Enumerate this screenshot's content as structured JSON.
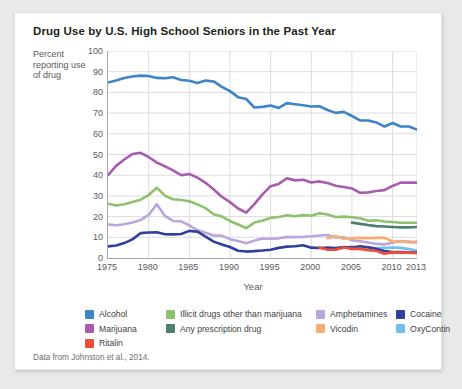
{
  "card": {
    "title": "Drug Use by U.S. High School Seniors in the Past Year",
    "source": "Data from Johnston et al., 2014."
  },
  "chart_data": {
    "type": "line",
    "title": "Drug Use by U.S. High School Seniors in the Past Year",
    "xlabel": "Year",
    "ylabel": "Percent reporting use of drug",
    "xlim": [
      1975,
      2013
    ],
    "ylim": [
      0,
      100
    ],
    "grid": true,
    "legend_position": "bottom",
    "xticks": [
      1975,
      1980,
      1985,
      1990,
      1995,
      2000,
      2005,
      2010,
      2013
    ],
    "yticks": [
      0,
      10,
      20,
      30,
      40,
      50,
      60,
      70,
      80,
      90,
      100
    ],
    "series": [
      {
        "name": "Alcohol",
        "color": "#3d85c8",
        "x": [
          1975,
          1976,
          1977,
          1978,
          1979,
          1980,
          1981,
          1982,
          1983,
          1984,
          1985,
          1986,
          1987,
          1988,
          1989,
          1990,
          1991,
          1992,
          1993,
          1994,
          1995,
          1996,
          1997,
          1998,
          1999,
          2000,
          2001,
          2002,
          2003,
          2004,
          2005,
          2006,
          2007,
          2008,
          2009,
          2010,
          2011,
          2012,
          2013
        ],
        "values": [
          84.8,
          85.7,
          87.0,
          87.7,
          88.1,
          87.9,
          87.0,
          86.8,
          87.3,
          86.0,
          85.6,
          84.5,
          85.7,
          85.3,
          82.7,
          80.6,
          77.7,
          76.8,
          72.7,
          73.0,
          73.7,
          72.5,
          74.8,
          74.3,
          73.8,
          73.2,
          73.3,
          71.5,
          70.1,
          70.6,
          68.6,
          66.5,
          66.4,
          65.5,
          63.5,
          65.2,
          63.5,
          63.5,
          62.0
        ]
      },
      {
        "name": "Marijuana",
        "color": "#a85cb0",
        "x": [
          1975,
          1976,
          1977,
          1978,
          1979,
          1980,
          1981,
          1982,
          1983,
          1984,
          1985,
          1986,
          1987,
          1988,
          1989,
          1990,
          1991,
          1992,
          1993,
          1994,
          1995,
          1996,
          1997,
          1998,
          1999,
          2000,
          2001,
          2002,
          2003,
          2004,
          2005,
          2006,
          2007,
          2008,
          2009,
          2010,
          2011,
          2012,
          2013
        ],
        "values": [
          40.0,
          44.5,
          47.6,
          50.2,
          50.8,
          48.8,
          46.1,
          44.3,
          42.3,
          40.0,
          40.6,
          38.8,
          36.3,
          33.1,
          29.6,
          27.0,
          23.9,
          21.9,
          26.0,
          30.7,
          34.7,
          35.8,
          38.5,
          37.5,
          37.8,
          36.5,
          37.0,
          36.2,
          34.9,
          34.3,
          33.6,
          31.5,
          31.7,
          32.4,
          32.8,
          34.8,
          36.4,
          36.4,
          36.4
        ]
      },
      {
        "name": "Illicit drugs other than marijuana",
        "color": "#8dc26f",
        "x": [
          1975,
          1976,
          1977,
          1978,
          1979,
          1980,
          1981,
          1982,
          1983,
          1984,
          1985,
          1986,
          1987,
          1988,
          1989,
          1990,
          1991,
          1992,
          1993,
          1994,
          1995,
          1996,
          1997,
          1998,
          1999,
          2000,
          2001,
          2002,
          2003,
          2004,
          2005,
          2006,
          2007,
          2008,
          2009,
          2010,
          2011,
          2012,
          2013
        ],
        "values": [
          26.2,
          25.4,
          26.0,
          27.1,
          28.2,
          30.4,
          34.0,
          30.1,
          28.4,
          28.0,
          27.4,
          25.9,
          24.1,
          21.1,
          20.0,
          17.9,
          16.2,
          14.4,
          17.1,
          18.0,
          19.4,
          19.8,
          20.7,
          20.2,
          20.7,
          20.4,
          21.6,
          21.0,
          19.8,
          20.0,
          19.7,
          19.2,
          18.0,
          18.2,
          17.6,
          17.4,
          17.0,
          17.0,
          17.0
        ]
      },
      {
        "name": "Any prescription drug",
        "color": "#4f7d72",
        "x": [
          2005,
          2006,
          2007,
          2008,
          2009,
          2010,
          2011,
          2012,
          2013
        ],
        "values": [
          17.1,
          16.5,
          15.9,
          15.4,
          15.2,
          15.0,
          14.8,
          14.8,
          15.0
        ]
      },
      {
        "name": "Amphetamines",
        "color": "#b9a5e0",
        "x": [
          1975,
          1976,
          1977,
          1978,
          1979,
          1980,
          1981,
          1982,
          1983,
          1984,
          1985,
          1986,
          1987,
          1988,
          1989,
          1990,
          1991,
          1992,
          1993,
          1994,
          1995,
          1996,
          1997,
          1998,
          1999,
          2000,
          2001,
          2002,
          2003,
          2004,
          2005,
          2006,
          2007,
          2008,
          2009,
          2010,
          2011,
          2012,
          2013
        ],
        "values": [
          16.2,
          15.8,
          16.3,
          17.1,
          18.3,
          20.8,
          26.0,
          20.3,
          17.9,
          17.7,
          15.8,
          13.4,
          12.2,
          10.9,
          10.8,
          9.1,
          8.2,
          7.1,
          8.4,
          9.4,
          9.3,
          9.5,
          10.2,
          10.1,
          10.2,
          10.5,
          10.9,
          11.1,
          9.9,
          10.0,
          8.6,
          8.1,
          7.5,
          6.8,
          6.6,
          7.4,
          8.2,
          7.9,
          7.4
        ]
      },
      {
        "name": "Vicodin",
        "color": "#f7ac72",
        "x": [
          2002,
          2003,
          2004,
          2005,
          2006,
          2007,
          2008,
          2009,
          2010,
          2011,
          2012,
          2013
        ],
        "values": [
          9.6,
          10.5,
          9.3,
          9.5,
          9.7,
          9.6,
          9.7,
          9.7,
          8.0,
          8.1,
          7.5,
          8.0
        ]
      },
      {
        "name": "Cocaine",
        "color": "#2f3f9e",
        "x": [
          1975,
          1976,
          1977,
          1978,
          1979,
          1980,
          1981,
          1982,
          1983,
          1984,
          1985,
          1986,
          1987,
          1988,
          1989,
          1990,
          1991,
          1992,
          1993,
          1994,
          1995,
          1996,
          1997,
          1998,
          1999,
          2000,
          2001,
          2002,
          2003,
          2004,
          2005,
          2006,
          2007,
          2008,
          2009,
          2010,
          2011,
          2012,
          2013
        ],
        "values": [
          5.6,
          6.0,
          7.2,
          9.0,
          12.0,
          12.3,
          12.4,
          11.5,
          11.4,
          11.6,
          13.1,
          12.7,
          10.3,
          7.9,
          6.5,
          5.3,
          3.5,
          3.1,
          3.3,
          3.6,
          4.0,
          4.9,
          5.5,
          5.7,
          6.2,
          5.0,
          4.8,
          5.0,
          4.8,
          5.3,
          5.1,
          5.7,
          5.2,
          4.4,
          3.4,
          2.9,
          2.9,
          2.7,
          2.6
        ]
      },
      {
        "name": "Ritalin",
        "color": "#f04c37",
        "x": [
          2001,
          2002,
          2003,
          2004,
          2005,
          2006,
          2007,
          2008,
          2009,
          2010,
          2011,
          2012,
          2013
        ],
        "values": [
          5.1,
          4.0,
          4.0,
          5.1,
          4.4,
          4.4,
          3.8,
          3.4,
          2.1,
          2.7,
          2.6,
          2.6,
          2.3
        ]
      },
      {
        "name": "OxyContin",
        "color": "#72bfe8",
        "x": [
          2002,
          2003,
          2004,
          2005,
          2006,
          2007,
          2008,
          2009,
          2010,
          2011,
          2012,
          2013
        ],
        "values": [
          4.0,
          4.5,
          5.0,
          5.5,
          4.3,
          5.2,
          4.7,
          4.9,
          5.1,
          4.9,
          4.3,
          3.6
        ]
      }
    ]
  },
  "legend": {
    "columns": [
      {
        "left": 0,
        "items": [
          {
            "label": "Alcohol",
            "color": "#3d85c8"
          },
          {
            "label": "Marijuana",
            "color": "#a85cb0"
          },
          {
            "label": "Ritalin",
            "color": "#f04c37"
          }
        ]
      },
      {
        "left": 81,
        "items": [
          {
            "label": "Illicit drugs other than marijuana",
            "color": "#8dc26f"
          },
          {
            "label": "Any prescription drug",
            "color": "#4f7d72"
          }
        ]
      },
      {
        "left": 231,
        "items": [
          {
            "label": "Amphetamines",
            "color": "#b9a5e0"
          },
          {
            "label": "Vicodin",
            "color": "#f7ac72"
          }
        ]
      },
      {
        "left": 311,
        "items": [
          {
            "label": "Cocaine",
            "color": "#2f3f9e"
          },
          {
            "label": "OxyContin",
            "color": "#72bfe8"
          }
        ]
      }
    ]
  }
}
